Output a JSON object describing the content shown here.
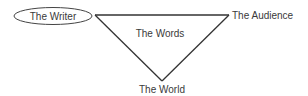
{
  "diagram": {
    "type": "rhetorical-triangle",
    "nodes": [
      {
        "id": "writer",
        "label": "The Writer",
        "shape": "ellipse",
        "position": "top-left"
      },
      {
        "id": "audience",
        "label": "The Audience",
        "shape": "none",
        "position": "top-right"
      },
      {
        "id": "world",
        "label": "The World",
        "shape": "none",
        "position": "bottom"
      }
    ],
    "center_label": "The Words",
    "edges": [
      {
        "from": "writer",
        "to": "audience"
      },
      {
        "from": "audience",
        "to": "world"
      },
      {
        "from": "world",
        "to": "writer"
      }
    ],
    "colors": {
      "line": "#333333",
      "text": "#3a3a3a",
      "background": "#ffffff"
    }
  }
}
